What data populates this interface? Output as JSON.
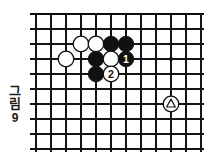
{
  "figure": {
    "caption_chars": [
      "그",
      "림"
    ],
    "caption_number": "9",
    "caption_full": "그림 9"
  },
  "board": {
    "type": "go-board-diagram",
    "columns": 12,
    "rows": 9,
    "cell_size": 15,
    "origin_x": 8,
    "origin_y": 8,
    "line_color": "#141414",
    "border_color": "#0d0d0d",
    "background_color": "#ffffff",
    "edges": {
      "top": true,
      "right": true,
      "left": false,
      "bottom": false
    },
    "star_points": [
      {
        "col": 9,
        "row": 3
      }
    ],
    "stones": [
      {
        "col": 2,
        "row": 3,
        "color": "white",
        "label": "",
        "mark": ""
      },
      {
        "col": 3,
        "row": 2,
        "color": "white",
        "label": "",
        "mark": ""
      },
      {
        "col": 4,
        "row": 2,
        "color": "white",
        "label": "",
        "mark": ""
      },
      {
        "col": 5,
        "row": 2,
        "color": "black",
        "label": "",
        "mark": ""
      },
      {
        "col": 6,
        "row": 2,
        "color": "black",
        "label": "",
        "mark": ""
      },
      {
        "col": 4,
        "row": 3,
        "color": "black",
        "label": "",
        "mark": ""
      },
      {
        "col": 5,
        "row": 3,
        "color": "white",
        "label": "",
        "mark": ""
      },
      {
        "col": 6,
        "row": 3,
        "color": "black",
        "label": "1",
        "mark": ""
      },
      {
        "col": 4,
        "row": 4,
        "color": "black",
        "label": "",
        "mark": ""
      },
      {
        "col": 5,
        "row": 4,
        "color": "white",
        "label": "2",
        "mark": ""
      },
      {
        "col": 9,
        "row": 6,
        "color": "white",
        "label": "",
        "mark": "triangle"
      }
    ],
    "colors": {
      "black_stone": "#111111",
      "white_stone": "#ffffff",
      "stone_outline": "#111111",
      "black_label": "#111111",
      "white_label": "#ffffff"
    }
  }
}
